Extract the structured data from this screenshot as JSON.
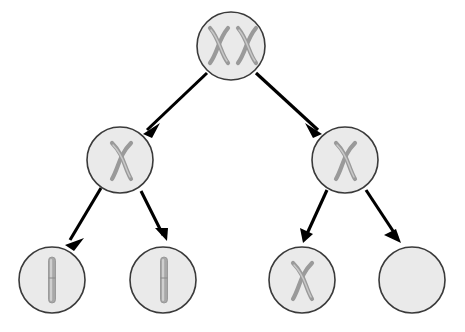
{
  "diagram": {
    "background_color": "#ffffff",
    "cell_fill_color": "#eaeaea",
    "cell_stroke_color": "#3a3a3a",
    "chromosome_color": "#9a9a9a",
    "chromosome_highlight_color": "#c8c8c8",
    "arrow_color": "#000000",
    "levels": 3,
    "cell_radius": 33,
    "cells": [
      {
        "id": "parent-cell",
        "level": 0,
        "label": "parent cell",
        "cx": 231,
        "cy": 46,
        "r": 34,
        "contents": "two-x-chromosomes",
        "chromosome_count": 2,
        "chromosome_shape": "x",
        "chromosome_positions": [
          {
            "cx": 218,
            "cy": 45
          },
          {
            "cx": 246,
            "cy": 45
          }
        ]
      },
      {
        "id": "daughter-cell-left",
        "level": 1,
        "label": "daughter cell left",
        "cx": 120,
        "cy": 160,
        "r": 33,
        "contents": "one-x-chromosome",
        "chromosome_count": 1,
        "chromosome_shape": "x",
        "chromosome_positions": [
          {
            "cx": 121,
            "cy": 161
          }
        ]
      },
      {
        "id": "daughter-cell-right",
        "level": 1,
        "label": "daughter cell right",
        "cx": 345,
        "cy": 160,
        "r": 33,
        "contents": "one-x-chromosome",
        "chromosome_count": 1,
        "chromosome_shape": "x",
        "chromosome_positions": [
          {
            "cx": 344,
            "cy": 161
          }
        ]
      },
      {
        "id": "gamete-cell-1",
        "level": 2,
        "label": "gamete cell one",
        "cx": 52,
        "cy": 280,
        "r": 33,
        "contents": "one-chromatid",
        "chromosome_count": 1,
        "chromosome_shape": "rod",
        "chromosome_positions": [
          {
            "cx": 52,
            "cy": 280
          }
        ]
      },
      {
        "id": "gamete-cell-2",
        "level": 2,
        "label": "gamete cell two",
        "cx": 163,
        "cy": 280,
        "r": 33,
        "contents": "one-chromatid",
        "chromosome_count": 1,
        "chromosome_shape": "rod",
        "chromosome_positions": [
          {
            "cx": 164,
            "cy": 280
          }
        ]
      },
      {
        "id": "gamete-cell-3",
        "level": 2,
        "label": "gamete cell three",
        "cx": 302,
        "cy": 280,
        "r": 33,
        "contents": "one-x-chromosome",
        "chromosome_count": 1,
        "chromosome_shape": "x",
        "chromosome_positions": [
          {
            "cx": 301,
            "cy": 281
          }
        ]
      },
      {
        "id": "gamete-cell-4",
        "level": 2,
        "label": "gamete cell four",
        "cx": 412,
        "cy": 280,
        "r": 33,
        "contents": "empty",
        "chromosome_count": 0,
        "chromosome_shape": "none",
        "chromosome_positions": []
      }
    ],
    "arrows": [
      {
        "id": "arrow-parent-to-left",
        "label": "parent to left daughter",
        "x1": 207,
        "y1": 73,
        "x2": 143,
        "y2": 134
      },
      {
        "id": "arrow-parent-to-right",
        "label": "parent to right daughter",
        "x1": 256,
        "y1": 73,
        "x2": 322,
        "y2": 134
      },
      {
        "id": "arrow-left-to-gamete-1",
        "label": "left daughter to gamete one",
        "x1": 101,
        "y1": 188,
        "x2": 65,
        "y2": 245
      },
      {
        "id": "arrow-left-to-gamete-2",
        "label": "left daughter to gamete two",
        "x1": 141,
        "y1": 191,
        "x2": 167,
        "y2": 241
      },
      {
        "id": "arrow-right-to-gamete-3",
        "label": "right daughter to gamete three",
        "x1": 327,
        "y1": 190,
        "x2": 303,
        "y2": 243
      },
      {
        "id": "arrow-right-to-gamete-4",
        "label": "right daughter to gamete four",
        "x1": 366,
        "y1": 190,
        "x2": 401,
        "y2": 243
      }
    ]
  }
}
